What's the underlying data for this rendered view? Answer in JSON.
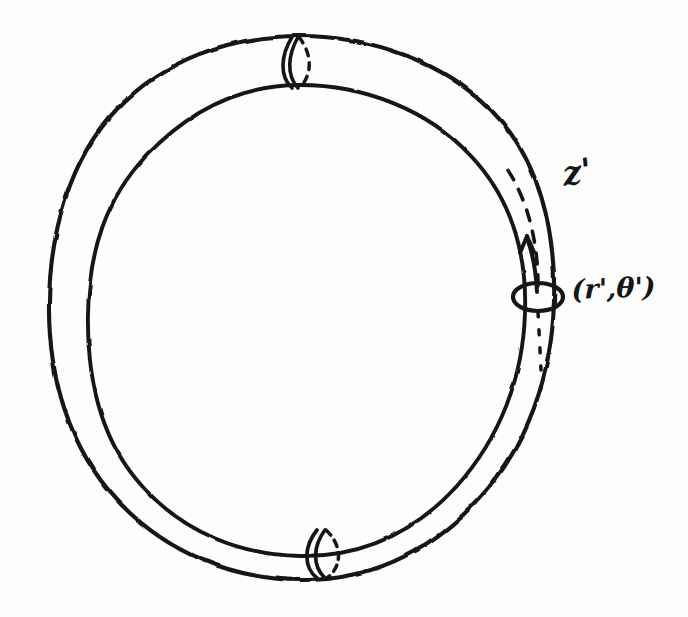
{
  "figure": {
    "kind": "hand-drawn-sketch",
    "background_color": "#fdfdfd",
    "ink_color": "#151515",
    "width": 688,
    "height": 617
  },
  "labels": {
    "axial_coordinate": "z'",
    "cross_section_coordinate": "(r',θ')"
  },
  "annotations": {
    "arrow": {
      "name": "z-direction-arrow",
      "description": "arrow pointing along the tube, counter-clockwise/upward"
    },
    "cross_section_ellipse": {
      "name": "cross-section-ellipse",
      "description": "small ellipse marking the (r', theta') cross-section of the tube"
    },
    "dashed_center_line": {
      "name": "tube-center-dashed-line",
      "description": "dashed core line running along the inside of the tube"
    },
    "seams": [
      {
        "name": "top-seam",
        "description": "cross-section seam at the top of the torus, solid front arc with dashed hidden arc"
      },
      {
        "name": "bottom-seam",
        "description": "cross-section seam at the bottom of the torus, solid front arc with dashed hidden arc"
      }
    ]
  },
  "geometry": {
    "outer_ring": {
      "name": "outer-ring-outline",
      "center": [
        300,
        308
      ],
      "radius_x": 252,
      "radius_y": 272
    },
    "inner_ring": {
      "name": "inner-ring-outline",
      "center": [
        300,
        312
      ],
      "radius_x": 212,
      "radius_y": 228
    },
    "cross_section_ellipse": {
      "center": [
        538,
        297
      ],
      "radius_x": 25,
      "radius_y": 14
    }
  }
}
